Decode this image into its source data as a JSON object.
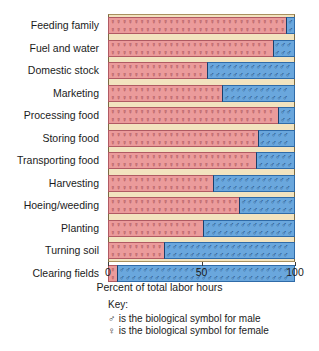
{
  "chart_data": {
    "type": "bar",
    "orientation": "horizontal",
    "stacked": true,
    "title": "",
    "xlabel": "Percent of total labor hours",
    "ylabel": "",
    "xlim": [
      0,
      100
    ],
    "xticks": [
      0,
      50,
      100
    ],
    "xtick_labels": [
      "0",
      "50",
      "100"
    ],
    "grid": false,
    "legend_position": "below-plot",
    "categories": [
      "Feeding family",
      "Fuel and water",
      "Domestic stock",
      "Marketing",
      "Processing food",
      "Storing food",
      "Transporting food",
      "Harvesting",
      "Hoeing/weeding",
      "Planting",
      "Turning soil",
      "Clearing fields"
    ],
    "series": [
      {
        "name": "female",
        "symbol": "♀",
        "color": "#eb9b9b",
        "values": [
          95,
          88,
          53,
          61,
          91,
          80,
          79,
          56,
          70,
          51,
          30,
          5
        ]
      },
      {
        "name": "male",
        "symbol": "♂",
        "color": "#6aa7dd",
        "values": [
          5,
          12,
          47,
          39,
          9,
          20,
          21,
          44,
          30,
          49,
          70,
          95
        ]
      }
    ]
  },
  "axis": {
    "x_title": "Percent of total labor hours",
    "tick_labels": [
      "0",
      "50",
      "100"
    ]
  },
  "key": {
    "title": "Key:",
    "male_symbol": "♂",
    "male_text": "is the biological symbol for male",
    "female_symbol": "♀",
    "female_text": "is the biological symbol for female"
  },
  "colors": {
    "female_fill": "#eb9b9b",
    "female_border": "#b05a63",
    "male_fill": "#6aa7dd",
    "male_border": "#2f6ba8",
    "panel_background": "#f2e3bf"
  }
}
